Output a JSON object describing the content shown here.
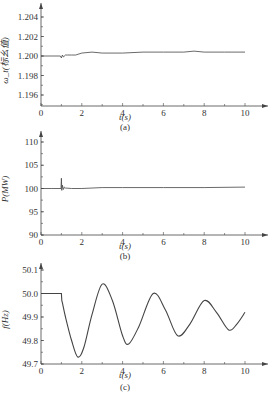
{
  "chart_data": [
    {
      "type": "line",
      "panel_label": "(a)",
      "title": "",
      "xlabel": "t(s)",
      "ylabel": "ω_t(标幺值)",
      "xlim": [
        0,
        10
      ],
      "ylim": [
        1.195,
        1.205
      ],
      "xticks": [
        "0",
        "2",
        "4",
        "6",
        "8",
        "10"
      ],
      "yticks": [
        "1.196",
        "1.198",
        "1.200",
        "1.202",
        "1.204"
      ],
      "grid": false,
      "x": [
        0,
        0.5,
        0.95,
        1.0,
        1.05,
        1.1,
        1.2,
        1.3,
        1.5,
        1.7,
        2.0,
        2.5,
        3.0,
        4.0,
        5.0,
        6.0,
        7.0,
        7.5,
        8.0,
        9.0,
        10.0
      ],
      "values": [
        1.2,
        1.2,
        1.2,
        1.1998,
        1.2001,
        1.1999,
        1.2001,
        1.2001,
        1.2001,
        1.2001,
        1.2003,
        1.2004,
        1.2003,
        1.2003,
        1.2004,
        1.2004,
        1.2004,
        1.2005,
        1.2004,
        1.2004,
        1.2004
      ]
    },
    {
      "type": "line",
      "panel_label": "(b)",
      "title": "",
      "xlabel": "t(s)",
      "ylabel": "P(MW)",
      "xlim": [
        0,
        10
      ],
      "ylim": [
        90,
        112
      ],
      "xticks": [
        "0",
        "2",
        "4",
        "6",
        "8",
        "10"
      ],
      "yticks": [
        "90",
        "95",
        "100",
        "105",
        "110"
      ],
      "grid": false,
      "x": [
        0,
        0.5,
        0.98,
        1.0,
        1.02,
        1.05,
        1.1,
        1.15,
        1.2,
        1.5,
        2.0,
        3.0,
        4.0,
        6.0,
        8.0,
        10.0
      ],
      "values": [
        100,
        100,
        100,
        102.2,
        99.6,
        100.7,
        99.8,
        100.3,
        100.1,
        100,
        100,
        100.2,
        100.2,
        100.2,
        100.2,
        100.3
      ]
    },
    {
      "type": "line",
      "panel_label": "(c)",
      "title": "",
      "xlabel": "t(s)",
      "ylabel": "f(Hz)",
      "xlim": [
        0,
        10
      ],
      "ylim": [
        49.7,
        50.12
      ],
      "xticks": [
        "0",
        "2",
        "4",
        "6",
        "8",
        "10"
      ],
      "yticks": [
        "49.7",
        "49.8",
        "49.9",
        "50.0",
        "50.1"
      ],
      "grid": false,
      "x": [
        0,
        0.5,
        1.0,
        1.02,
        1.05,
        1.2,
        1.5,
        1.8,
        2.1,
        2.5,
        3.0,
        3.5,
        4.0,
        4.3,
        4.8,
        5.5,
        6.1,
        6.7,
        7.3,
        8.0,
        8.6,
        9.2,
        9.6,
        10.0
      ],
      "values": [
        50.0,
        50.0,
        50.0,
        49.97,
        49.96,
        49.9,
        49.8,
        49.73,
        49.77,
        49.91,
        50.04,
        49.97,
        49.82,
        49.785,
        49.86,
        50.0,
        49.93,
        49.82,
        49.87,
        49.97,
        49.92,
        49.845,
        49.87,
        49.92
      ]
    }
  ],
  "labels": {
    "panel_a": "(a)",
    "panel_b": "(b)",
    "panel_c": "(c)",
    "xlabel": "t(s)",
    "ylabel_a": "ω_t(标幺值)",
    "ylabel_b": "P(MW)",
    "ylabel_c": "f(Hz)"
  },
  "style": {
    "line_color": "#444444",
    "axis_color": "#444444"
  }
}
